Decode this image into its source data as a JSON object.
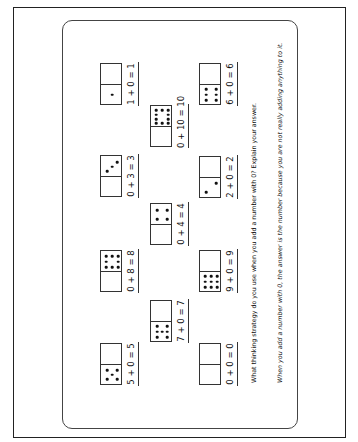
{
  "worksheet": {
    "dominoes": [
      {
        "id": "d1",
        "equation": "1 + 0 = 1",
        "x": 100,
        "y": 63,
        "top_dots": 0,
        "bottom_dots": 1,
        "line_x": 126
      },
      {
        "id": "d2",
        "equation": "6 + 0 = 6",
        "x": 199,
        "y": 63,
        "top_dots": 0,
        "bottom_dots": 6,
        "line_x": 225
      },
      {
        "id": "d3",
        "equation": "0 + 10 = 10",
        "x": 150,
        "y": 105,
        "top_dots": 10,
        "bottom_dots": 0,
        "line_x": 176
      },
      {
        "id": "d4",
        "equation": "0 + 3 = 3",
        "x": 100,
        "y": 155,
        "top_dots": 3,
        "bottom_dots": 0,
        "line_x": 126
      },
      {
        "id": "d5",
        "equation": "2 + 0 = 2",
        "x": 199,
        "y": 156,
        "top_dots": 0,
        "bottom_dots": 2,
        "line_x": 225
      },
      {
        "id": "d6",
        "equation": "0 + 4 = 4",
        "x": 150,
        "y": 203,
        "top_dots": 4,
        "bottom_dots": 0,
        "line_x": 176
      },
      {
        "id": "d7",
        "equation": "0 + 8 = 8",
        "x": 100,
        "y": 250,
        "top_dots": 8,
        "bottom_dots": 0,
        "line_x": 126
      },
      {
        "id": "d8",
        "equation": "9 + 0 = 9",
        "x": 199,
        "y": 250,
        "top_dots": 0,
        "bottom_dots": 9,
        "line_x": 225
      },
      {
        "id": "d9",
        "equation": "7 + 0 = 7",
        "x": 150,
        "y": 300,
        "top_dots": 0,
        "bottom_dots": 7,
        "line_x": 176
      },
      {
        "id": "d10",
        "equation": "5 + 0 = 5",
        "x": 100,
        "y": 343,
        "top_dots": 0,
        "bottom_dots": 5,
        "line_x": 126
      },
      {
        "id": "d11",
        "equation": "0 + 0 = 0",
        "x": 199,
        "y": 343,
        "top_dots": 0,
        "bottom_dots": 0,
        "line_x": 225
      }
    ],
    "question": "What thinking strategy do you use when you add a number with 0? Explain your answer.",
    "answer": "When you add a number with 0, the answer is the number because you are not really adding anything to it."
  }
}
